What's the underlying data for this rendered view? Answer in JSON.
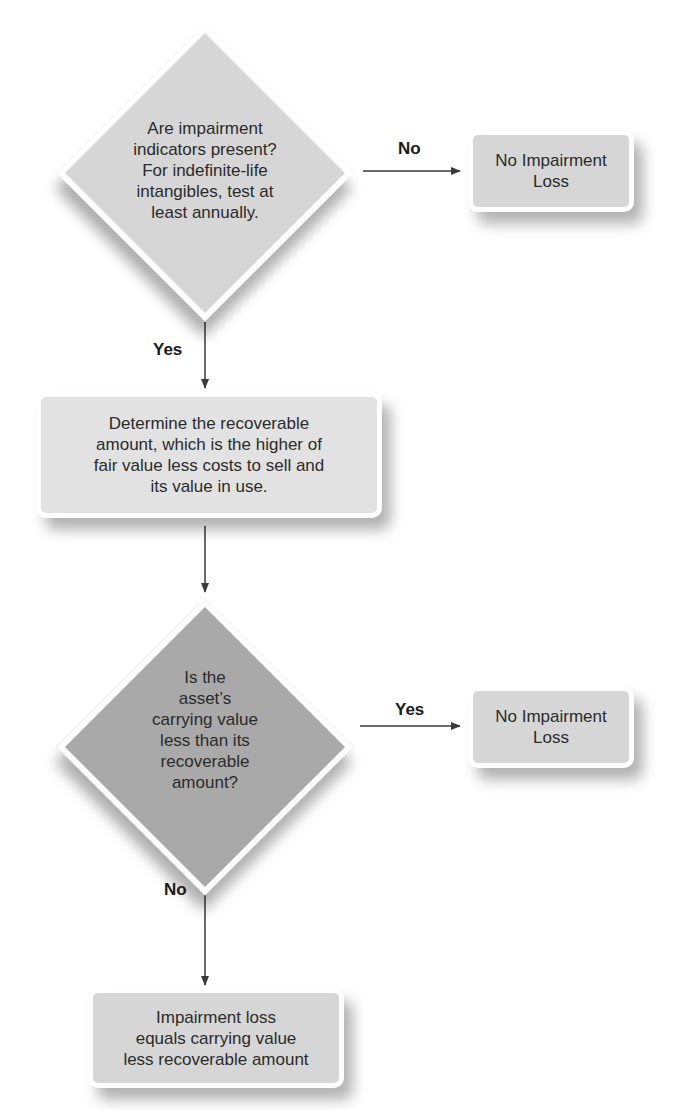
{
  "diagram": {
    "type": "flowchart",
    "colors": {
      "decision_1_fill": "#d6d6d6",
      "decision_2_fill": "#a9a9a9",
      "process_fill": "#e2e2e2",
      "terminal_fill": "#d6d6d6",
      "arrow": "#3a3a3a",
      "border": "#ffffff"
    },
    "nodes": {
      "decision_1": {
        "text": "Are impairment indicators present? For indefinite-life intangibles, test at least annually.",
        "lines": [
          "Are impairment",
          "indicators present?",
          "For indefinite-life",
          "intangibles, test at",
          "least annually."
        ]
      },
      "result_1": {
        "lines": [
          "No Impairment",
          "Loss"
        ]
      },
      "process_1": {
        "lines": [
          "Determine the recoverable",
          "amount, which is the higher of",
          "fair value less costs to sell and",
          "its value in use."
        ]
      },
      "decision_2": {
        "lines": [
          "Is the",
          "asset’s",
          "carrying value",
          "less than its",
          "recoverable",
          "amount?"
        ]
      },
      "result_2": {
        "lines": [
          "No Impairment",
          "Loss"
        ]
      },
      "result_3": {
        "lines": [
          "Impairment loss",
          "equals carrying value",
          "less recoverable amount"
        ]
      }
    },
    "edges": {
      "d1_to_r1": {
        "label": "No"
      },
      "d1_to_p1": {
        "label": "Yes"
      },
      "p1_to_d2": {
        "label": ""
      },
      "d2_to_r2": {
        "label": "Yes"
      },
      "d2_to_r3": {
        "label": "No"
      }
    }
  }
}
